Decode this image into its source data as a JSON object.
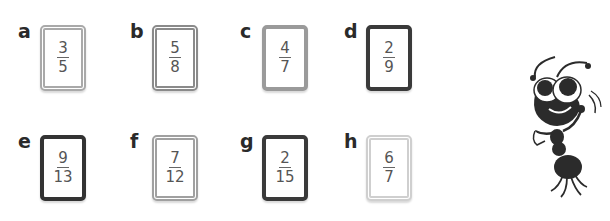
{
  "cards": [
    {
      "label": "a",
      "numerator": "3",
      "denominator": "5",
      "border_color": "#a9a9a9",
      "border_style": "double"
    },
    {
      "label": "b",
      "numerator": "5",
      "denominator": "8",
      "border_color": "#8a8a8a",
      "border_style": "double"
    },
    {
      "label": "c",
      "numerator": "4",
      "denominator": "7",
      "border_color": "#9a9a9a",
      "border_style": "solid"
    },
    {
      "label": "d",
      "numerator": "2",
      "denominator": "9",
      "border_color": "#3a3a3a",
      "border_style": "solid"
    },
    {
      "label": "e",
      "numerator": "9",
      "denominator": "13",
      "border_color": "#333333",
      "border_style": "solid"
    },
    {
      "label": "f",
      "numerator": "7",
      "denominator": "12",
      "border_color": "#a0a0a0",
      "border_style": "double"
    },
    {
      "label": "g",
      "numerator": "2",
      "denominator": "15",
      "border_color": "#3a3a3a",
      "border_style": "solid"
    },
    {
      "label": "h",
      "numerator": "6",
      "denominator": "7",
      "border_color": "#cfcfcf",
      "border_style": "double"
    }
  ],
  "illustration": {
    "name": "thinking-ant",
    "color": "#2b2b2b"
  }
}
